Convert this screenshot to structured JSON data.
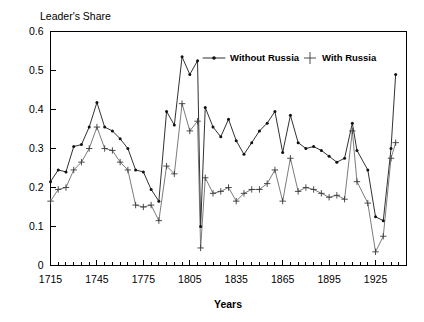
{
  "chart_data": {
    "type": "line",
    "title": "Leader's Share",
    "xlabel": "Years",
    "ylabel": "Leader's Share",
    "xlim": [
      1715,
      1945
    ],
    "ylim": [
      0,
      0.6
    ],
    "grid": false,
    "legend_position": "top-center",
    "y_ticks": [
      0,
      0.1,
      0.2,
      0.3,
      0.4,
      0.5,
      0.6
    ],
    "y_tick_labels": [
      "0",
      "0.1",
      "0.2",
      "0.3",
      "0.4",
      "0.5",
      "0.6"
    ],
    "x_ticks": [
      1715,
      1745,
      1775,
      1805,
      1835,
      1865,
      1895,
      1925
    ],
    "x_tick_labels": [
      "1715",
      "1745",
      "1775",
      "1805",
      "1835",
      "1865",
      "1895",
      "1925"
    ],
    "x_minor_tick_step": 5,
    "x": [
      1715,
      1720,
      1725,
      1730,
      1735,
      1740,
      1745,
      1750,
      1755,
      1760,
      1765,
      1770,
      1775,
      1780,
      1785,
      1790,
      1795,
      1800,
      1805,
      1810,
      1812,
      1815,
      1820,
      1825,
      1830,
      1835,
      1840,
      1845,
      1850,
      1855,
      1860,
      1865,
      1870,
      1875,
      1880,
      1885,
      1890,
      1895,
      1900,
      1905,
      1910,
      1913,
      1920,
      1925,
      1930,
      1935,
      1938
    ],
    "series": [
      {
        "name": "Without Russia",
        "marker": "dot",
        "color": "#111111",
        "values": [
          0.215,
          0.245,
          0.24,
          0.305,
          0.31,
          0.355,
          0.418,
          0.355,
          0.345,
          0.325,
          0.3,
          0.245,
          0.24,
          0.195,
          0.165,
          0.395,
          0.36,
          0.535,
          0.49,
          0.525,
          0.1,
          0.405,
          0.355,
          0.33,
          0.375,
          0.32,
          0.285,
          0.315,
          0.345,
          0.365,
          0.395,
          0.29,
          0.385,
          0.315,
          0.3,
          0.305,
          0.295,
          0.28,
          0.265,
          0.275,
          0.365,
          0.295,
          0.245,
          0.125,
          0.115,
          0.3,
          0.49
        ]
      },
      {
        "name": "With Russia",
        "marker": "plus",
        "color": "#3a3a3a",
        "values": [
          0.165,
          0.195,
          0.2,
          0.245,
          0.265,
          0.3,
          0.355,
          0.3,
          0.295,
          0.265,
          0.245,
          0.155,
          0.15,
          0.155,
          0.115,
          0.255,
          0.235,
          0.415,
          0.345,
          0.37,
          0.045,
          0.225,
          0.185,
          0.19,
          0.2,
          0.165,
          0.185,
          0.195,
          0.195,
          0.21,
          0.245,
          0.165,
          0.275,
          0.19,
          0.2,
          0.195,
          0.185,
          0.175,
          0.18,
          0.17,
          0.345,
          0.215,
          0.16,
          0.035,
          0.075,
          0.275,
          0.315
        ]
      }
    ]
  },
  "legend": {
    "items": [
      {
        "label": "Without Russia",
        "marker": "line-dot"
      },
      {
        "label": "With Russia",
        "marker": "plus"
      }
    ]
  },
  "labels": {
    "title": "Leader's Share",
    "xaxis_title": "Years"
  }
}
